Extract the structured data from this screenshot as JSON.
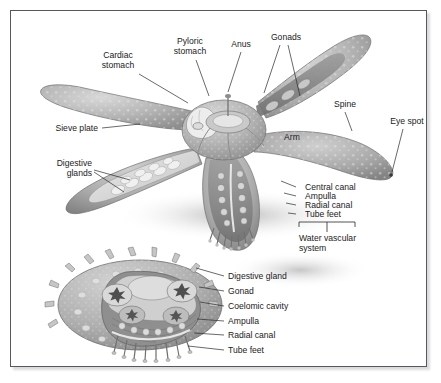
{
  "figure": {
    "title_visible": false,
    "background": "#ffffff",
    "border_color": "#55585c",
    "body_gray": "#b0b0b0",
    "panels": [
      {
        "name": "whole-animal-cutaway",
        "description": "five-armed sea star viewed from above with arms cut away to reveal internal organs"
      },
      {
        "name": "arm-cross-section",
        "description": "transverse cross-section through a single arm"
      }
    ]
  },
  "top_panel": {
    "labels": [
      {
        "id": "cardiac-stomach",
        "text_lines": [
          "Cardiac",
          "stomach"
        ],
        "x": 118,
        "y": 58,
        "align": "middle",
        "leaders": [
          [
            139,
            74,
            188,
            103
          ]
        ]
      },
      {
        "id": "pyloric-stomach",
        "text_lines": [
          "Pyloric",
          "stomach"
        ],
        "x": 190,
        "y": 44,
        "align": "middle",
        "leaders": [
          [
            196,
            60,
            209,
            96
          ]
        ]
      },
      {
        "id": "anus",
        "text_lines": [
          "Anus"
        ],
        "x": 241,
        "y": 47,
        "align": "middle",
        "leaders": [
          [
            241,
            52,
            228,
            92
          ]
        ]
      },
      {
        "id": "gonads",
        "text_lines": [
          "Gonads"
        ],
        "x": 286,
        "y": 40,
        "align": "middle",
        "leaders": [
          [
            280,
            45,
            264,
            93
          ],
          [
            288,
            45,
            300,
            96
          ]
        ]
      },
      {
        "id": "spine",
        "text_lines": [
          "Spine"
        ],
        "x": 345,
        "y": 107,
        "align": "middle",
        "leaders": [
          [
            345,
            112,
            352,
            131
          ]
        ]
      },
      {
        "id": "eye-spot",
        "text_lines": [
          "Eye spot"
        ],
        "x": 407,
        "y": 124,
        "align": "middle",
        "leaders": [
          [
            403,
            129,
            392,
            172
          ]
        ]
      },
      {
        "id": "arm",
        "text_lines": [
          "Arm"
        ],
        "x": 292,
        "y": 140,
        "align": "middle",
        "leaders": []
      },
      {
        "id": "sieve-plate",
        "text_lines": [
          "Sieve plate"
        ],
        "x": 98,
        "y": 131,
        "align": "end",
        "leaders": [
          [
            102,
            128,
            140,
            124
          ]
        ]
      },
      {
        "id": "digestive-glands",
        "text_lines": [
          "Digestive",
          "glands"
        ],
        "x": 92,
        "y": 166,
        "align": "end",
        "leaders": [
          [
            94,
            170,
            130,
            180
          ],
          [
            94,
            172,
            124,
            192
          ]
        ]
      }
    ],
    "right_stack": {
      "items": [
        {
          "id": "central-canal",
          "text": "Central canal",
          "x": 305,
          "y": 190,
          "leader": [
            296,
            187,
            281,
            181
          ]
        },
        {
          "id": "ampulla",
          "text": "Ampulla",
          "x": 305,
          "y": 199,
          "leader": [
            296,
            196,
            284,
            193
          ]
        },
        {
          "id": "radial-canal",
          "text": "Radial canal",
          "x": 305,
          "y": 208,
          "leader": [
            296,
            205,
            286,
            203
          ]
        },
        {
          "id": "tube-feet",
          "text": "Tube feet",
          "x": 305,
          "y": 217,
          "leader": [
            296,
            214,
            288,
            213
          ]
        }
      ],
      "bracket": {
        "left": 299,
        "right": 355,
        "top": 222,
        "stem_x": 327,
        "stem_bottom": 232
      },
      "group_label": {
        "id": "water-vascular-system",
        "text_lines": [
          "Water vascular",
          "system"
        ],
        "x": 299,
        "y": 241
      }
    }
  },
  "bottom_panel": {
    "labels": [
      {
        "id": "digestive-gland",
        "text": "Digestive gland",
        "x": 228,
        "y": 279,
        "leader": [
          224,
          276,
          196,
          268
        ]
      },
      {
        "id": "gonad",
        "text": "Gonad",
        "x": 228,
        "y": 294,
        "leader": [
          224,
          291,
          199,
          287
        ]
      },
      {
        "id": "coelomic-cavity",
        "text": "Coelomic cavity",
        "x": 228,
        "y": 309,
        "leader": [
          224,
          306,
          200,
          302
        ]
      },
      {
        "id": "ampulla-cs",
        "text": "Ampulla",
        "x": 228,
        "y": 324,
        "leader": [
          224,
          321,
          197,
          319
        ]
      },
      {
        "id": "radial-canal-cs",
        "text": "Radial canal",
        "x": 228,
        "y": 338,
        "leader": [
          224,
          335,
          194,
          333
        ]
      },
      {
        "id": "tube-feet-cs",
        "text": "Tube feet",
        "x": 228,
        "y": 353,
        "leader": [
          224,
          350,
          188,
          346
        ]
      }
    ]
  }
}
